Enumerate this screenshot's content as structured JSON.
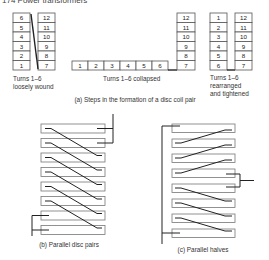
{
  "header": {
    "title": "174 Power transformers"
  },
  "panel_a": {
    "caption": "(a) Steps in the formation of a disc coil pair",
    "step1": {
      "left_column": [
        "6",
        "5",
        "4",
        "3",
        "2",
        "1"
      ],
      "right_column": [
        "12",
        "11",
        "10",
        "9",
        "8",
        "7"
      ],
      "caption_line1": "Turns 1–6",
      "caption_line2": "loosely wound"
    },
    "step2": {
      "row": [
        "1",
        "2",
        "3",
        "4",
        "5",
        "6"
      ],
      "column": [
        "12",
        "11",
        "10",
        "9",
        "8",
        "7"
      ],
      "caption": "Turns 1–6 collapsed"
    },
    "step3": {
      "left_column": [
        "1",
        "2",
        "3",
        "4",
        "5",
        "6"
      ],
      "right_column": [
        "12",
        "11",
        "10",
        "9",
        "8",
        "7"
      ],
      "caption_line1": "Turns 1–6",
      "caption_line2": "rearranged",
      "caption_line3": "and tightened"
    }
  },
  "panel_b": {
    "caption": "(b) Parallel disc pairs",
    "coil_count": 8
  },
  "panel_c": {
    "caption": "(c) Parallel halves",
    "coil_count": 8
  }
}
